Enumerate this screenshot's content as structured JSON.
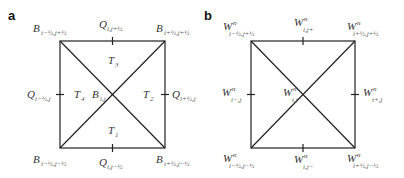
{
  "figure": {
    "panels": [
      {
        "letter": "a",
        "square": {
          "x1": 60,
          "y1": 41,
          "x2": 165,
          "y2": 148
        },
        "labels": {
          "top_left": {
            "main": "B",
            "sub": "i−½,j+½"
          },
          "top_mid": {
            "main": "Q",
            "sub": "i,j+½"
          },
          "top_right": {
            "main": "B",
            "sub": "i+½,j+½"
          },
          "left_mid": {
            "main": "Q",
            "sub": "i−½,j"
          },
          "right_mid": {
            "main": "Q",
            "sub": "i+½,j"
          },
          "bottom_left": {
            "main": "B",
            "sub": "i−½,j−½"
          },
          "bottom_mid": {
            "main": "Q",
            "sub": "i,j−½"
          },
          "bottom_right": {
            "main": "B",
            "sub": "i+½,j−½"
          },
          "center": {
            "main": "B",
            "sub": "i,j"
          }
        },
        "triangles": {
          "t1": {
            "main": "T",
            "sub": "1"
          },
          "t2": {
            "main": "T",
            "sub": "2"
          },
          "t3": {
            "main": "T",
            "sub": "3"
          },
          "t4": {
            "main": "T",
            "sub": "4"
          }
        }
      },
      {
        "letter": "b",
        "square": {
          "x1": 251,
          "y1": 41,
          "x2": 355,
          "y2": 148
        },
        "labels": {
          "top_left": {
            "main": "W",
            "sup": "n",
            "sub": "i−½,j+½"
          },
          "top_mid": {
            "main": "W",
            "sup": "n",
            "sub": "i,j+"
          },
          "top_right": {
            "main": "W",
            "sup": "n",
            "sub": "i+½,j+½"
          },
          "left_mid": {
            "main": "W",
            "sup": "n",
            "sub": "i−,j"
          },
          "right_mid": {
            "main": "W",
            "sup": "n",
            "sub": "i+,j"
          },
          "bottom_left": {
            "main": "W",
            "sup": "n",
            "sub": "i−½,j−½"
          },
          "bottom_mid": {
            "main": "W",
            "sup": "n",
            "sub": "i,j−"
          },
          "bottom_right": {
            "main": "W",
            "sup": "n",
            "sub": "i+½,j−½"
          },
          "center": {
            "main": "W",
            "sup": "n",
            "sub": "i,j"
          }
        }
      }
    ]
  }
}
